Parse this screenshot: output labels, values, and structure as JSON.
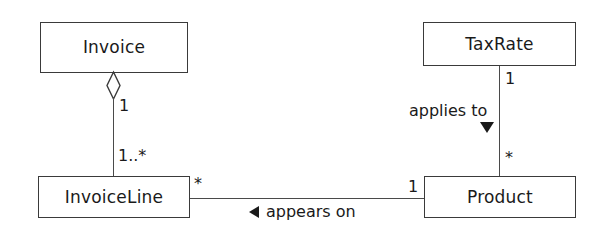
{
  "diagram": {
    "type": "uml-class-diagram",
    "background_color": "#ffffff",
    "line_color": "#4a4a4a",
    "text_color": "#1a1a1a",
    "classes": [
      {
        "id": "invoice",
        "name": "Invoice"
      },
      {
        "id": "invoiceline",
        "name": "InvoiceLine"
      },
      {
        "id": "taxrate",
        "name": "TaxRate"
      },
      {
        "id": "product",
        "name": "Product"
      }
    ],
    "relationships": [
      {
        "id": "invoice-invoiceline",
        "kind": "aggregation",
        "from": "Invoice",
        "to": "InvoiceLine",
        "source_multiplicity": "1",
        "target_multiplicity": "1..*",
        "label": "",
        "decorator": "hollow-diamond"
      },
      {
        "id": "taxrate-product",
        "kind": "association",
        "from": "TaxRate",
        "to": "Product",
        "source_multiplicity": "1",
        "target_multiplicity": "*",
        "label": "applies to",
        "decorator": "solid-triangle-down"
      },
      {
        "id": "invoiceline-product",
        "kind": "association",
        "from": "InvoiceLine",
        "to": "Product",
        "source_multiplicity": "*",
        "target_multiplicity": "1",
        "label": "appears on",
        "decorator": "solid-triangle-left"
      }
    ],
    "multiplicities": {
      "invoice_end": "1",
      "invoiceline_end": "1..*",
      "invoiceline_right": "*",
      "product_left": "1",
      "product_top": "*",
      "taxrate_bottom": "1"
    },
    "labels": {
      "applies_to": "applies to",
      "appears_on": "appears on"
    }
  }
}
